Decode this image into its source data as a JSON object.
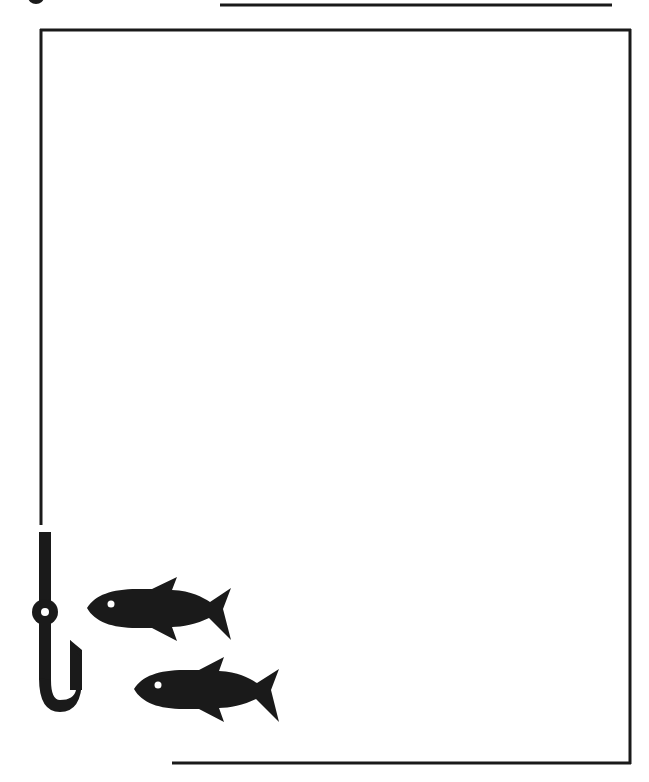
{
  "page": {
    "colors": {
      "ink": "#1a1a1a",
      "paper": "#ffffff"
    }
  },
  "decorations": {
    "top_rule": {
      "x1": 220,
      "x2": 612,
      "y": 5
    },
    "frame": {
      "left": 41,
      "top": 30,
      "right": 630,
      "bottom": 763,
      "left_line_end": 525,
      "bottom_line_start": 172
    },
    "hook": {
      "icon": "fishing-hook-icon"
    },
    "fish": [
      {
        "icon": "fish-icon",
        "x": 87,
        "y": 577
      },
      {
        "icon": "fish-icon",
        "x": 134,
        "y": 657
      }
    ]
  }
}
